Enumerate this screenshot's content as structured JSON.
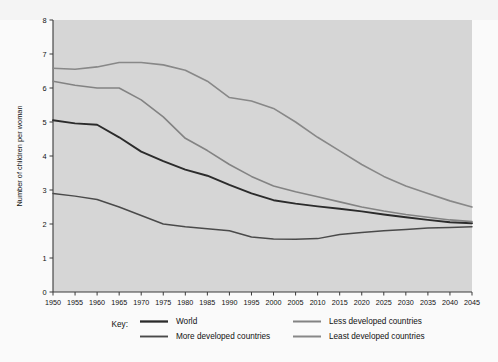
{
  "figure": {
    "background_color": "#fafafa",
    "plot_background_color": "#d6d6d6",
    "axis_color": "#3a3a3a"
  },
  "chart_data": {
    "type": "line",
    "title": "",
    "xlabel": "",
    "ylabel": "Number of children per woman",
    "xlim": [
      1950,
      2045
    ],
    "ylim": [
      0,
      8
    ],
    "grid": false,
    "legend_position": "bottom",
    "legend_key_label": "Key:",
    "x": [
      1950,
      1955,
      1960,
      1965,
      1970,
      1975,
      1980,
      1985,
      1990,
      1995,
      2000,
      2005,
      2010,
      2015,
      2020,
      2025,
      2030,
      2035,
      2040,
      2045
    ],
    "xtick_labels": [
      "1950",
      "1955",
      "1960",
      "1965",
      "1970",
      "1975",
      "1980",
      "1985",
      "1990",
      "1995",
      "2000",
      "2005",
      "2010",
      "2015",
      "2020",
      "2025",
      "2030",
      "2035",
      "2040",
      "2045"
    ],
    "ytick_labels": [
      "0",
      "1",
      "2",
      "3",
      "4",
      "5",
      "6",
      "7",
      "8"
    ],
    "yticks": [
      0,
      1,
      2,
      3,
      4,
      5,
      6,
      7,
      8
    ],
    "series": [
      {
        "name": "World",
        "color": "#2b2b2b",
        "width": 1.9,
        "values": [
          5.05,
          4.96,
          4.92,
          4.55,
          4.13,
          3.85,
          3.6,
          3.42,
          3.15,
          2.9,
          2.7,
          2.6,
          2.52,
          2.45,
          2.37,
          2.28,
          2.2,
          2.12,
          2.05,
          2.02
        ]
      },
      {
        "name": "More developed countries",
        "color": "#4a4a4a",
        "width": 1.5,
        "values": [
          2.9,
          2.82,
          2.72,
          2.5,
          2.25,
          2.0,
          1.92,
          1.86,
          1.8,
          1.62,
          1.56,
          1.55,
          1.57,
          1.69,
          1.75,
          1.8,
          1.84,
          1.88,
          1.9,
          1.92
        ]
      },
      {
        "name": "Less developed countries",
        "color": "#838383",
        "width": 1.6,
        "values": [
          6.2,
          6.08,
          6.0,
          6.0,
          5.65,
          5.15,
          4.52,
          4.16,
          3.75,
          3.4,
          3.12,
          2.95,
          2.8,
          2.65,
          2.5,
          2.38,
          2.28,
          2.2,
          2.12,
          2.07
        ]
      },
      {
        "name": "Least developed countries",
        "color": "#888888",
        "width": 1.6,
        "values": [
          6.58,
          6.55,
          6.62,
          6.75,
          6.75,
          6.68,
          6.52,
          6.2,
          5.72,
          5.62,
          5.4,
          5.0,
          4.55,
          4.15,
          3.75,
          3.4,
          3.12,
          2.9,
          2.68,
          2.5
        ]
      }
    ]
  },
  "legend": {
    "key_label": "Key:",
    "entries": [
      {
        "label": "World",
        "color": "#2b2b2b",
        "column": "left",
        "row": 0
      },
      {
        "label": "More developed countries",
        "color": "#4a4a4a",
        "column": "left",
        "row": 1
      },
      {
        "label": "Less developed countries",
        "color": "#838383",
        "column": "right",
        "row": 0
      },
      {
        "label": "Least developed countries",
        "color": "#888888",
        "column": "right",
        "row": 1
      }
    ]
  }
}
